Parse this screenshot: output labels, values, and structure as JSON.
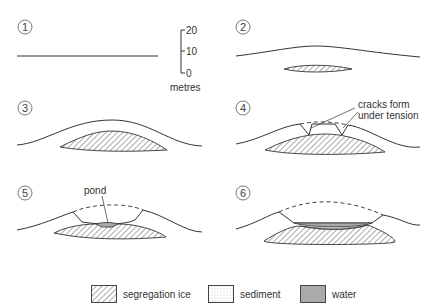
{
  "panels": [
    {
      "number": "1",
      "stage": "flat ground surface"
    },
    {
      "number": "2",
      "stage": "ice lens begins to grow, surface bulges"
    },
    {
      "number": "3",
      "stage": "segregation ice grows, mound rises"
    },
    {
      "number": "4",
      "stage": "cracks form at summit"
    },
    {
      "number": "5",
      "stage": "summit collapses, pond forms"
    },
    {
      "number": "6",
      "stage": "ice melts, water-filled depression"
    }
  ],
  "scale": {
    "ticks": [
      "20",
      "10",
      "0"
    ],
    "unit": "metres"
  },
  "annotations": {
    "cracks": "cracks form under tension",
    "cracks_line1": "cracks form",
    "cracks_line2": "under tension",
    "pond": "pond"
  },
  "legend": [
    {
      "label": "segregation ice",
      "pattern": "diagonal-hatch"
    },
    {
      "label": "sediment",
      "pattern": "stipple"
    },
    {
      "label": "water",
      "pattern": "grey-fill",
      "color": "#aaaaaa"
    }
  ]
}
